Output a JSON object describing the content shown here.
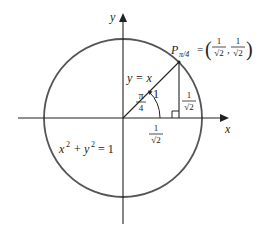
{
  "diagram": {
    "axes": {
      "x_label": "x",
      "y_label": "y"
    },
    "circle": {
      "equation_lhs_x": "x",
      "equation_exp_x": "2",
      "equation_plus": "+",
      "equation_lhs_y": "y",
      "equation_exp_y": "2",
      "equation_rhs": "= 1"
    },
    "ray": {
      "label": "y = x",
      "length_label": "1"
    },
    "angle": {
      "numerator": "π",
      "denominator": "4"
    },
    "point": {
      "name": "P",
      "subscript": "π/4",
      "equals": "=",
      "x_num": "1",
      "x_den": "√2",
      "y_num": "1",
      "y_den": "√2",
      "open_paren": "(",
      "comma": ",",
      "close_paren": ")"
    },
    "horizontal_leg": {
      "numerator": "1",
      "denominator": "√2"
    },
    "vertical_leg": {
      "numerator": "1",
      "denominator": "√2"
    },
    "colors": {
      "circle": "#555555",
      "lines": "#222222",
      "text": "#222222"
    }
  }
}
